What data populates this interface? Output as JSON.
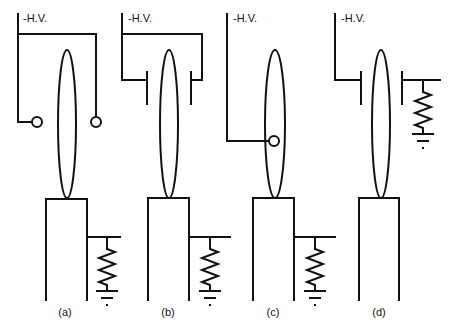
{
  "figure": {
    "colors": {
      "line": "#111111",
      "background": "#ffffff"
    },
    "panels": [
      {
        "id": "a",
        "label": "(a)",
        "hv_label": "-H.V.",
        "electrode": "two ring electrodes on both sides",
        "load": "resistor to ground from holder"
      },
      {
        "id": "b",
        "label": "(b)",
        "hv_label": "-H.V.",
        "electrode": "two parallel plate electrodes on both sides",
        "load": "resistor to ground from holder"
      },
      {
        "id": "c",
        "label": "(c)",
        "hv_label": "-H.V.",
        "electrode": "single ring electrode on emitter",
        "load": "resistor to ground from holder"
      },
      {
        "id": "d",
        "label": "(d)",
        "hv_label": "-H.V.",
        "electrode": "single plate electrode, opposite plate to resistor to ground",
        "load": "resistor to ground from opposite plate"
      }
    ]
  }
}
